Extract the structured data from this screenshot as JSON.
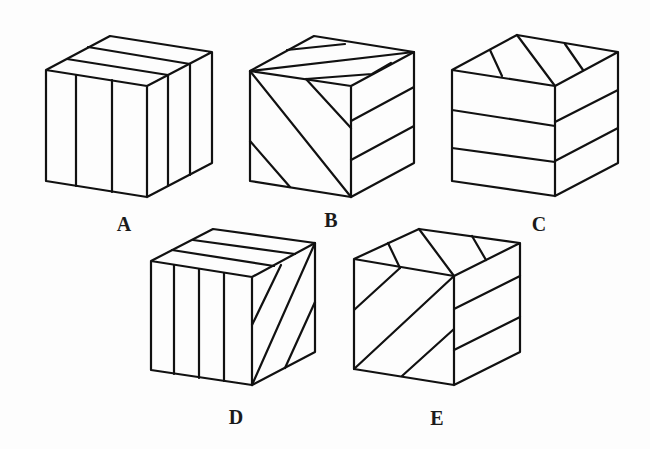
{
  "options": [
    {
      "label": "A",
      "front": "vertical stripes",
      "top": "stripes parallel to front edge",
      "right": "vertical stripes"
    },
    {
      "label": "B",
      "front": "diagonal stripes",
      "top": "diagonal stripes",
      "right": "horizontal stripes"
    },
    {
      "label": "C",
      "front": "horizontal stripes",
      "top": "diagonal stripes",
      "right": "horizontal stripes"
    },
    {
      "label": "D",
      "front": "vertical stripes",
      "top": "stripes parallel to front edge",
      "right": "diagonal stripes"
    },
    {
      "label": "E",
      "front": "diagonal stripes",
      "top": "diagonal stripes",
      "right": "horizontal stripes"
    }
  ],
  "colors": {
    "line": "#111111",
    "background": "#fdfdfd"
  }
}
